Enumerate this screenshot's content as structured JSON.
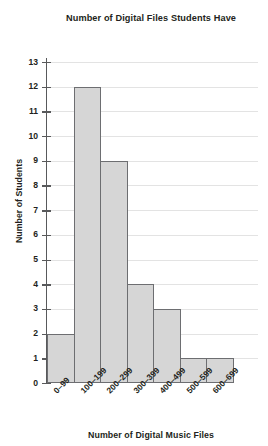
{
  "chart_data": {
    "type": "bar",
    "title": "Number of Digital Files Students Have",
    "xlabel": "Number of Digital Music Files",
    "ylabel": "Number of Students",
    "categories": [
      "0–99",
      "100–199",
      "200–299",
      "300–399",
      "400–499",
      "500–599",
      "600–699"
    ],
    "values": [
      2,
      12,
      9,
      4,
      3,
      1,
      1
    ],
    "ylim": [
      0,
      13
    ],
    "ytick_labels": [
      "0",
      "1",
      "2",
      "3",
      "4",
      "5",
      "6",
      "7",
      "8",
      "9",
      "10",
      "11",
      "12",
      "13"
    ],
    "ytick_values": [
      0,
      1,
      2,
      3,
      4,
      5,
      6,
      7,
      8,
      9,
      10,
      11,
      12,
      13
    ],
    "grid": "horizontal",
    "legend": "none",
    "bar_fill_color": "#d6d6d6",
    "bar_border_color": "#6d6e71",
    "gridline_color": "#e3e3e3",
    "axis_color": "#58595b",
    "text_color": "#231f20",
    "background_color": "#ffffff"
  }
}
